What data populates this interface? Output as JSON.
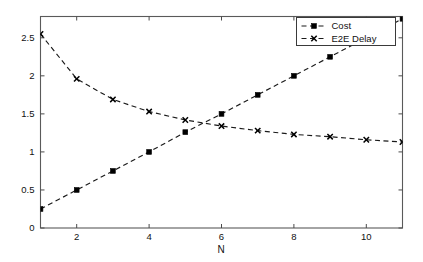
{
  "figure": {
    "background_color": "#ffffff",
    "axes_color": "#5a5a5a",
    "series_color": "#000000"
  },
  "chart_data": {
    "type": "line",
    "title": "",
    "subtitle": "",
    "xlabel": "N",
    "ylabel": "",
    "x": [
      1,
      2,
      3,
      4,
      5,
      6,
      7,
      8,
      9,
      10,
      11
    ],
    "xlim": [
      1,
      11
    ],
    "ylim": [
      0,
      2.78
    ],
    "xticks": [
      2,
      4,
      6,
      8,
      10
    ],
    "xtick_labels": [
      "2",
      "4",
      "6",
      "8",
      "10"
    ],
    "yticks": [
      0,
      0.5,
      1,
      1.5,
      2,
      2.5
    ],
    "ytick_labels": [
      "0",
      "0.5",
      "1",
      "1.5",
      "2",
      "2.5"
    ],
    "grid": false,
    "legend_position": "upper right",
    "series": [
      {
        "name": "Cost",
        "marker": "square",
        "linestyle": "dashed",
        "values": [
          0.25,
          0.5,
          0.75,
          1.0,
          1.26,
          1.5,
          1.75,
          2.0,
          2.25,
          2.5,
          2.75
        ]
      },
      {
        "name": "E2E Delay",
        "marker": "x",
        "linestyle": "dashed",
        "values": [
          2.55,
          1.96,
          1.69,
          1.53,
          1.42,
          1.34,
          1.28,
          1.23,
          1.2,
          1.16,
          1.13
        ]
      }
    ]
  },
  "legend": {
    "entries": [
      {
        "label": "Cost"
      },
      {
        "label": "E2E Delay"
      }
    ]
  }
}
